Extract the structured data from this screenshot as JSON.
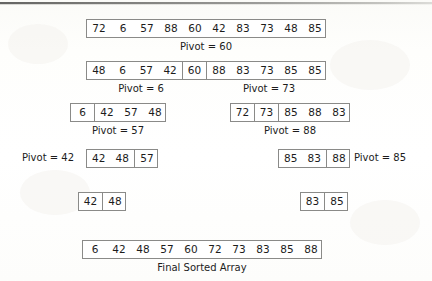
{
  "diagram": {
    "title_caption": "Final Sorted Array",
    "rows": [
      {
        "id": "row-initial",
        "groups": [
          {
            "values": [
              "72",
              "6",
              "57",
              "88",
              "60",
              "42",
              "83",
              "73",
              "48",
              "85"
            ]
          }
        ],
        "captions": [
          {
            "text": "Pivot = 60"
          }
        ]
      },
      {
        "id": "row-partition-60",
        "groups": [
          {
            "values": [
              "48",
              "6",
              "57",
              "42"
            ]
          },
          {
            "values": [
              "60"
            ]
          },
          {
            "values": [
              "88",
              "83",
              "73",
              "85",
              "85"
            ]
          }
        ],
        "captions": [
          {
            "text": "Pivot = 6"
          },
          {
            "text": "Pivot = 73"
          }
        ]
      },
      {
        "id": "row-left-partition-6",
        "groups": [
          {
            "values": [
              "6"
            ]
          },
          {
            "values": [
              "42",
              "57",
              "48"
            ]
          }
        ],
        "captions": [
          {
            "text": "Pivot = 57"
          }
        ]
      },
      {
        "id": "row-right-partition-73",
        "groups": [
          {
            "values": [
              "72"
            ]
          },
          {
            "values": [
              "73"
            ]
          },
          {
            "values": [
              "85",
              "88",
              "83"
            ]
          }
        ],
        "captions": [
          {
            "text": "Pivot = 88"
          }
        ]
      },
      {
        "id": "row-left-partition-57",
        "groups": [
          {
            "values": [
              "42",
              "48"
            ]
          },
          {
            "values": [
              "57"
            ]
          }
        ],
        "captions": [
          {
            "text": "Pivot = 42"
          }
        ]
      },
      {
        "id": "row-right-partition-88",
        "groups": [
          {
            "values": [
              "85",
              "83"
            ]
          },
          {
            "values": [
              "88"
            ]
          }
        ],
        "captions": [
          {
            "text": "Pivot = 85"
          }
        ]
      },
      {
        "id": "row-left-pair",
        "groups": [
          {
            "values": [
              "42"
            ]
          },
          {
            "values": [
              "48"
            ]
          }
        ],
        "captions": []
      },
      {
        "id": "row-right-pair",
        "groups": [
          {
            "values": [
              "83"
            ]
          },
          {
            "values": [
              "85"
            ]
          }
        ],
        "captions": []
      },
      {
        "id": "row-final",
        "groups": [
          {
            "values": [
              "6",
              "42",
              "48",
              "57",
              "60",
              "72",
              "73",
              "83",
              "85",
              "88"
            ]
          }
        ],
        "captions": [
          {
            "text": "Final Sorted Array"
          }
        ]
      }
    ]
  },
  "labels": {
    "pivot_60": "Pivot = 60",
    "pivot_6": "Pivot = 6",
    "pivot_73": "Pivot = 73",
    "pivot_57": "Pivot = 57",
    "pivot_88": "Pivot = 88",
    "pivot_42": "Pivot = 42",
    "pivot_85": "Pivot = 85",
    "final": "Final Sorted Array"
  },
  "values": {
    "initial": [
      "72",
      "6",
      "57",
      "88",
      "60",
      "42",
      "83",
      "73",
      "48",
      "85"
    ],
    "after_60_left": [
      "48",
      "6",
      "57",
      "42"
    ],
    "after_60_pivot": [
      "60"
    ],
    "after_60_right": [
      "88",
      "83",
      "73",
      "85",
      "85"
    ],
    "left_6": [
      "6"
    ],
    "left_rest": [
      "42",
      "57",
      "48"
    ],
    "right_72": [
      "72"
    ],
    "right_73": [
      "73"
    ],
    "right_rest": [
      "85",
      "88",
      "83"
    ],
    "l4_a": [
      "42",
      "48"
    ],
    "l4_b": [
      "57"
    ],
    "r4_a": [
      "85",
      "83"
    ],
    "r4_b": [
      "88"
    ],
    "l5_a": [
      "42"
    ],
    "l5_b": [
      "48"
    ],
    "r5_a": [
      "83"
    ],
    "r5_b": [
      "85"
    ],
    "final": [
      "6",
      "42",
      "48",
      "57",
      "60",
      "72",
      "73",
      "83",
      "85",
      "88"
    ]
  },
  "colors": {
    "border": "#8a8a88",
    "text": "#1c1c1c",
    "page": "#fdfdfb"
  }
}
